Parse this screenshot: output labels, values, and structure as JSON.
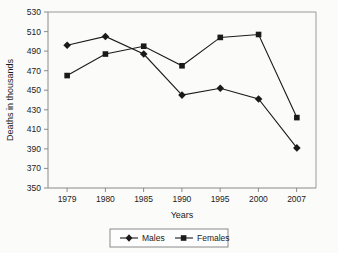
{
  "chart_data": {
    "type": "line",
    "title": "",
    "xlabel": "Years",
    "ylabel": "Deaths in thousands",
    "categories": [
      "1979",
      "1980",
      "1985",
      "1990",
      "1995",
      "2000",
      "2007"
    ],
    "series": [
      {
        "name": "Males",
        "marker": "diamond",
        "color": "#1a1a1a",
        "values": [
          496,
          505,
          487,
          445,
          452,
          441,
          391
        ]
      },
      {
        "name": "Females",
        "marker": "square",
        "color": "#1a1a1a",
        "values": [
          465,
          487,
          495,
          475,
          504,
          507,
          422
        ]
      }
    ],
    "ylim": [
      350,
      530
    ],
    "ytick_step": 20,
    "yticks": [
      "530",
      "510",
      "490",
      "470",
      "450",
      "430",
      "410",
      "390",
      "370",
      "350"
    ],
    "grid": false,
    "legend_position": "bottom",
    "axis_color": "#8a8a8a",
    "plot_background": "#fbfbfa",
    "page_background": "#ffffff"
  },
  "legend": {
    "items": [
      {
        "label": "Males",
        "marker": "diamond"
      },
      {
        "label": "Females",
        "marker": "square"
      }
    ]
  }
}
